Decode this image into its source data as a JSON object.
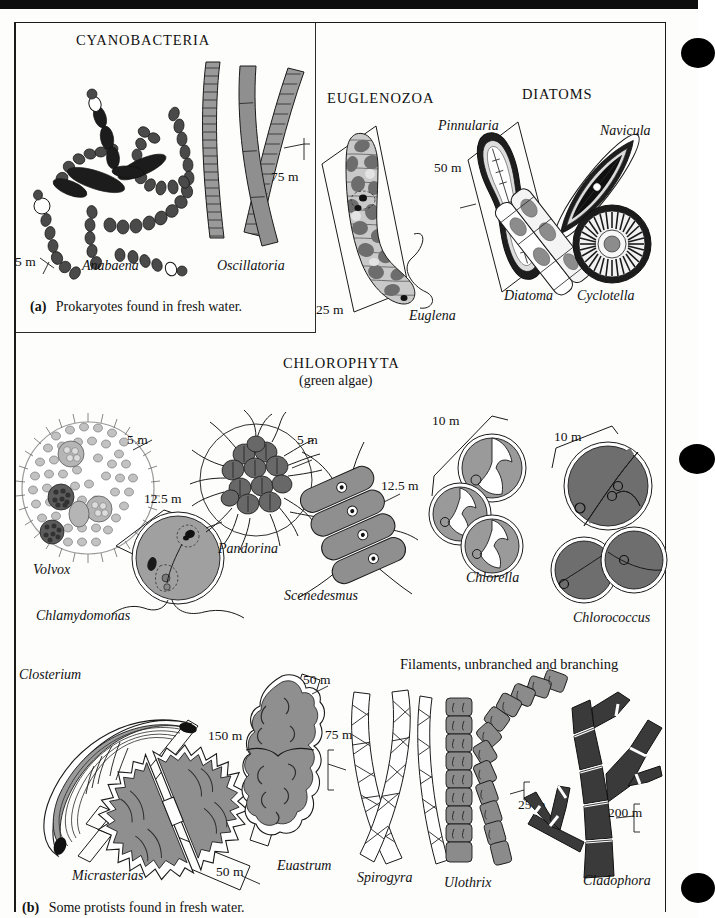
{
  "figure": {
    "title_a": "Prokaryotes found in fresh water.",
    "title_b": "Some protists found in fresh water.",
    "label_a": "(a)",
    "label_b": "(b)"
  },
  "groups": {
    "cyanobacteria": "CYANOBACTERIA",
    "euglenozoa": "EUGLENOZOA",
    "diatoms": "DIATOMS",
    "chlorophyta": "CHLOROPHYTA",
    "chlorophyta_sub": "(green algae)",
    "filaments": "Filaments, unbranched and branching"
  },
  "organisms": {
    "anabaena": "Anabaena",
    "oscillatoria": "Oscillatoria",
    "euglena": "Euglena",
    "pinnularia": "Pinnularia",
    "navicula": "Navicula",
    "diatoma": "Diatoma",
    "cyclotella": "Cyclotella",
    "volvox": "Volvox",
    "chlamydomonas": "Chlamydomonas",
    "pandorina": "Pandorina",
    "scenedesmus": "Scenedesmus",
    "chlorella": "Chlorella",
    "chlorococcus": "Chlorococcus",
    "closterium": "Closterium",
    "micrasterias": "Micrasterias",
    "euastrum": "Euastrum",
    "spirogyra": "Spirogyra",
    "ulothrix": "Ulothrix",
    "cladophora": "Cladophora"
  },
  "scale_bars": {
    "anabaena": "5  m",
    "oscillatoria": "75  m",
    "euglena": "25  m",
    "pinnularia": "50  m",
    "volvox": "5  m",
    "chlamydomonas": "12.5  m",
    "pandorina": "5  m",
    "scenedesmus": "12.5  m",
    "chlorella": "10  m",
    "chlorococcus": "10  m",
    "closterium": "150  m",
    "micrasterias": "50  m",
    "euastrum": "50  m",
    "spirogyra": "75  m",
    "ulothrix": "25  m",
    "cladophora": "200  m"
  },
  "colors": {
    "ink": "#1a1a1a",
    "dark_gray": "#4a4a4a",
    "mid_gray": "#8d8d8d",
    "light_gray": "#bdbdbd",
    "pale_gray": "#d8d8d8",
    "deep_gray": "#6e6e6e",
    "paper": "#fdfdfb"
  }
}
